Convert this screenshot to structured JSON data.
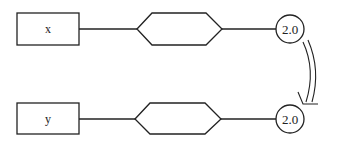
{
  "diagram": {
    "rows": [
      {
        "box_label": "x",
        "circle_label": "2.0"
      },
      {
        "box_label": "y",
        "circle_label": "2.0"
      }
    ],
    "connector": {
      "type": "double-curved-arrow",
      "from": "row-0-circle",
      "to": "row-1-circle"
    }
  },
  "colors": {
    "stroke": "#222222",
    "background": "#ffffff"
  }
}
